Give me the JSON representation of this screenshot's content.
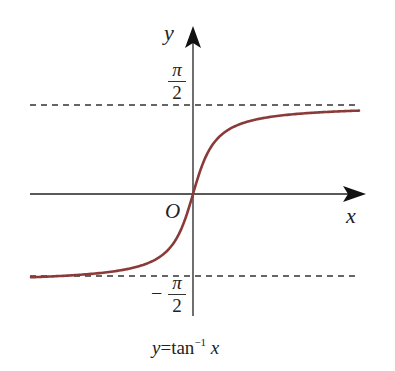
{
  "chart_data": {
    "type": "line",
    "function": "arctan",
    "xlabel": "x",
    "ylabel": "y",
    "origin_label": "O",
    "asymptotes": [
      {
        "y": 1.5708,
        "label": "π/2",
        "style": "dashed"
      },
      {
        "y": -1.5708,
        "label": "-π/2",
        "style": "dashed"
      }
    ],
    "series": [
      {
        "name": "y = tan^-1 x",
        "color": "#8b3a3a",
        "x": [
          -10,
          -6,
          -4,
          -3,
          -2,
          -1.5,
          -1,
          -0.5,
          0,
          0.5,
          1,
          1.5,
          2,
          3,
          4,
          6,
          10
        ],
        "y": [
          -1.471,
          -1.406,
          -1.326,
          -1.249,
          -1.107,
          -0.983,
          -0.785,
          -0.464,
          0,
          0.464,
          0.785,
          0.983,
          1.107,
          1.249,
          1.326,
          1.406,
          1.471
        ]
      }
    ],
    "grid": false,
    "legend": "none"
  },
  "labels": {
    "y_axis": "y",
    "x_axis": "x",
    "origin": "O",
    "upper_num": "π",
    "upper_den": "2",
    "lower_minus": "−",
    "lower_num": "π",
    "lower_den": "2",
    "caption_prefix": "y",
    "caption_eq": "=tan",
    "caption_sup": "−1",
    "caption_var": "x"
  },
  "colors": {
    "curve": "#8b3a3a",
    "axis": "#222222",
    "asymptote": "#333333"
  }
}
